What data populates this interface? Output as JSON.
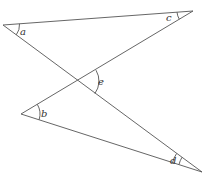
{
  "diagram": {
    "stroke_color": "#555555",
    "vertices": {
      "A": {
        "x": 3,
        "y": 25
      },
      "C": {
        "x": 193,
        "y": 11
      },
      "B": {
        "x": 21,
        "y": 114
      },
      "D": {
        "x": 202,
        "y": 172
      },
      "X": {
        "x": 78,
        "y": 81
      }
    },
    "angle_labels": {
      "a": "a",
      "b": "b",
      "c": "c",
      "d": "d",
      "e": "e"
    }
  }
}
